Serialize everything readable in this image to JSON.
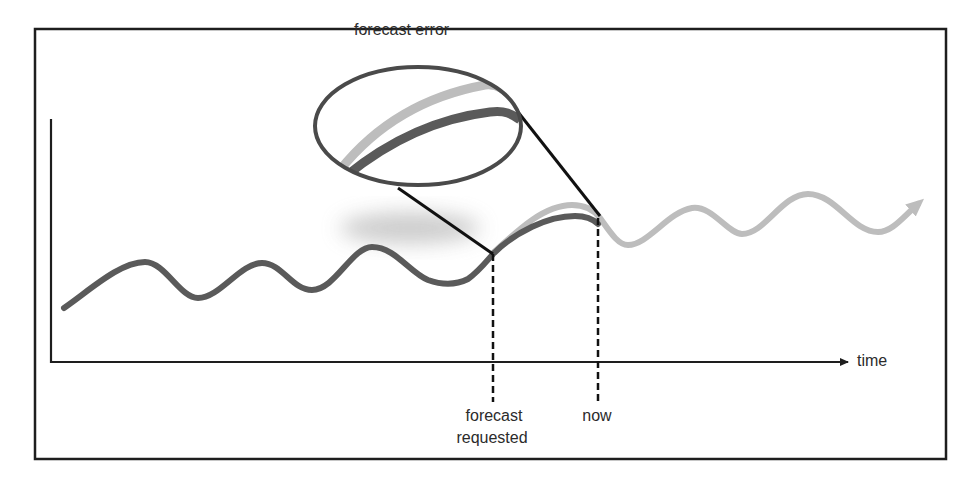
{
  "diagram": {
    "title_callout": "forecast error",
    "x_axis_label": "time",
    "markers": [
      {
        "label_line1": "forecast",
        "label_line2": "requested"
      },
      {
        "label_line1": "now"
      }
    ],
    "series": [
      {
        "name": "actual",
        "color": "#5a5a5a"
      },
      {
        "name": "forecast",
        "color": "#bdbdbd"
      }
    ],
    "colors": {
      "frame": "#1e1e1e",
      "axis": "#1e1e1e",
      "ellipse": "#4a4a4a",
      "connector": "#111111",
      "shadow": "#c8c8c8"
    }
  }
}
